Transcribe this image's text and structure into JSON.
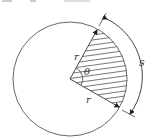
{
  "diagram": {
    "labels": {
      "radius_upper": "r",
      "radius_lower": "r",
      "angle": "θ",
      "arc_length": "s"
    },
    "top_cutoff_text": [
      "▪▪▪",
      "▪▪",
      "▪▪▪▪▪▪▪▪"
    ],
    "colors": {
      "line": "#444444",
      "hatch": "#555555",
      "background": "#ffffff"
    },
    "geometry": {
      "center": [
        70,
        79
      ],
      "radius": 57
    }
  }
}
